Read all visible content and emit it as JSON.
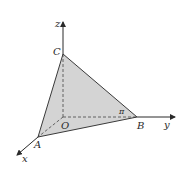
{
  "diagram": {
    "type": "3d-coordinate-tetrahedron",
    "colors": {
      "face_fill": "#d4d4d4",
      "edge": "#3a3a3a",
      "axis": "#2a2a2a",
      "background": "#ffffff"
    },
    "axes": {
      "x": "x",
      "y": "y",
      "z": "z"
    },
    "points": {
      "origin": "O",
      "A": "A",
      "B": "B",
      "C": "C"
    },
    "angle_label": "π"
  }
}
